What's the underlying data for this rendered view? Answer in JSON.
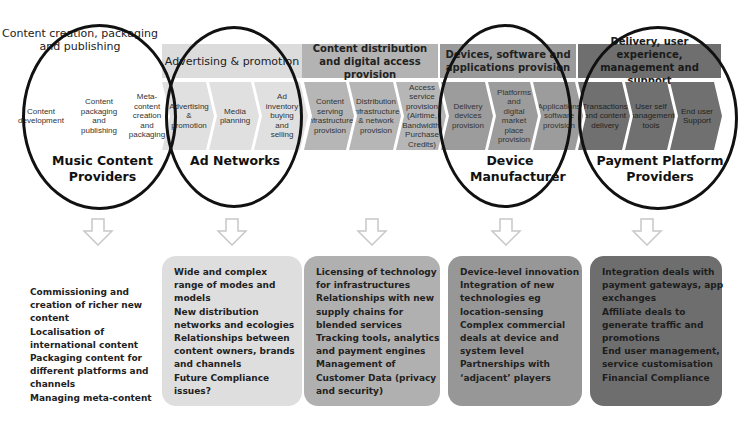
{
  "bands": [
    {
      "label": "Content creation, packaging and publishing"
    },
    {
      "label": "Advertising & promotion"
    },
    {
      "label": "Content distribution and digital access provision"
    },
    {
      "label": "Devices, software and applications provision"
    },
    {
      "label": "Delivery, user experience, management and support"
    }
  ],
  "chevrons": [
    {
      "label": "Content development"
    },
    {
      "label": "Content packaging and publishing"
    },
    {
      "label": "Meta-content creation and packaging"
    },
    {
      "label": "Advertising & promotion"
    },
    {
      "label": "Media planning"
    },
    {
      "label": "Ad inventory buying and selling"
    },
    {
      "label": "Content serving infrastructure provision"
    },
    {
      "label": "Distribution infrastructure & network provision"
    },
    {
      "label": "Access service provision (Airtime, Bandwidth, Purchase Credits)"
    },
    {
      "label": "Delivery devices provision"
    },
    {
      "label": "Platforms and digital market place provision"
    },
    {
      "label": "Applications software provision"
    },
    {
      "label": "Transactions and content delivery"
    },
    {
      "label": "User self management tools"
    },
    {
      "label": "End user Support"
    }
  ],
  "providers": [
    {
      "label": "Music Content Providers"
    },
    {
      "label": "Ad Networks"
    },
    {
      "label": "Device Manufacturer"
    },
    {
      "label": "Payment Platform Providers"
    }
  ],
  "boxes": [
    {
      "lines": [
        "Commissioning and",
        "creation of richer new",
        "content",
        "Localisation of",
        "international content",
        "Packaging content for",
        "different platforms and",
        "channels",
        "Managing meta-content"
      ]
    },
    {
      "lines": [
        "Wide and complex",
        "range of modes and",
        "models",
        "New distribution",
        "networks and ecologies",
        "Relationships between",
        "content owners, brands",
        "and channels",
        "Future Compliance",
        "issues?"
      ]
    },
    {
      "lines": [
        "Licensing of technology",
        "for infrastructures",
        "Relationships  with new",
        "supply chains  for",
        "blended services",
        "Tracking tools, analytics",
        "and payment engines",
        "Management of",
        "Customer Data (privacy",
        "and security)"
      ]
    },
    {
      "lines": [
        "Device-level innovation",
        "Integration of new",
        "technologies eg",
        "location-sensing",
        "Complex commercial",
        "deals at device and",
        "system level",
        " Partnerships with",
        "‘adjacent’ players"
      ]
    },
    {
      "lines": [
        "Integration deals with",
        "payment gateways, app",
        "exchanges",
        " Affiliate deals to",
        "generate traffic and",
        "promotions",
        "End user management,",
        "service customisation",
        "Financial Compliance"
      ]
    }
  ],
  "colors": {
    "band_1": "#dcdcdc",
    "band_2": "#b3b3b3",
    "band_3": "#9a9a9a",
    "band_4": "#6f6f6f",
    "ellipse_stroke": "#111111",
    "arrow_stroke": "#c8c8c8"
  }
}
